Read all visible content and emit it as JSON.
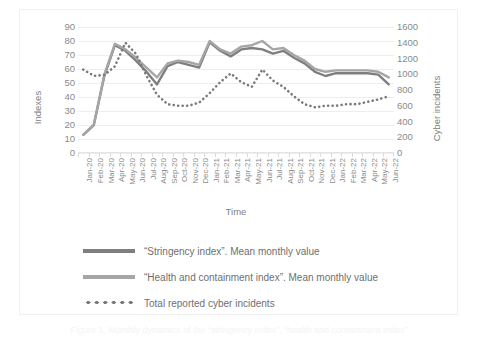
{
  "axes": {
    "y_left_title": "Indexes",
    "y_right_title": "Cyber incidents",
    "x_title": "Time"
  },
  "legend": {
    "items": [
      {
        "label": "“Stringency index”. Mean monthly value",
        "style": "solid",
        "color": "#7f7f7f"
      },
      {
        "label": "“Health and containment index”. Mean monthly value",
        "style": "solid",
        "color": "#a6a6a6"
      },
      {
        "label": "Total reported cyber incidents",
        "style": "dotted",
        "color": "#7a7a7a"
      }
    ]
  },
  "caption": "Figure 1. Monthly dynamics of the “stringency index”, “health and containment index”",
  "chart_data": {
    "type": "line",
    "title": "",
    "xlabel": "Time",
    "ylabel": "Indexes",
    "y2label": "Cyber incidents",
    "ylim": [
      0,
      90
    ],
    "y2lim": [
      0,
      1600
    ],
    "yticks": [
      0,
      10,
      20,
      30,
      40,
      50,
      60,
      70,
      80,
      90
    ],
    "y2ticks": [
      0,
      200,
      400,
      600,
      800,
      1000,
      1200,
      1400,
      1600
    ],
    "grid": true,
    "legend_position": "bottom",
    "categories": [
      "Jan-20",
      "Feb-20",
      "Mar-20",
      "Apr-20",
      "May-20",
      "Jun-20",
      "Jul-20",
      "Aug-20",
      "Sep-20",
      "Oct-20",
      "Nov-20",
      "Dec-20",
      "Jan-21",
      "Feb-21",
      "Mar-21",
      "Apr-21",
      "May-21",
      "Jun-21",
      "Jul-21",
      "Aug-21",
      "Sep-21",
      "Oct-21",
      "Nov-21",
      "Dec-21",
      "Jan-22",
      "Feb-22",
      "Mar-22",
      "Apr-22",
      "May-22",
      "Jun-22"
    ],
    "series": [
      {
        "name": "“Stringency index”. Mean monthly value",
        "axis": "left",
        "style": "solid",
        "color": "#7f7f7f",
        "values": [
          13,
          20,
          55,
          77,
          73,
          66,
          58,
          49,
          62,
          65,
          63,
          61,
          79,
          73,
          69,
          74,
          75,
          74,
          71,
          73,
          68,
          64,
          58,
          55,
          57,
          57,
          57,
          57,
          56,
          49
        ]
      },
      {
        "name": "“Health and containment index”. Mean monthly value",
        "axis": "left",
        "style": "solid",
        "color": "#a6a6a6",
        "values": [
          13,
          20,
          56,
          78,
          74,
          68,
          61,
          54,
          64,
          66,
          65,
          63,
          80,
          74,
          71,
          76,
          77,
          80,
          74,
          75,
          70,
          66,
          60,
          58,
          59,
          59,
          59,
          59,
          58,
          54
        ]
      },
      {
        "name": "Total reported cyber incidents",
        "axis": "right",
        "style": "dotted",
        "color": "#7a7a7a",
        "values": [
          1060,
          980,
          990,
          1100,
          1400,
          1260,
          980,
          740,
          620,
          600,
          600,
          640,
          760,
          900,
          1010,
          900,
          840,
          1060,
          920,
          840,
          720,
          620,
          580,
          600,
          600,
          620,
          620,
          650,
          680,
          720
        ]
      }
    ]
  }
}
